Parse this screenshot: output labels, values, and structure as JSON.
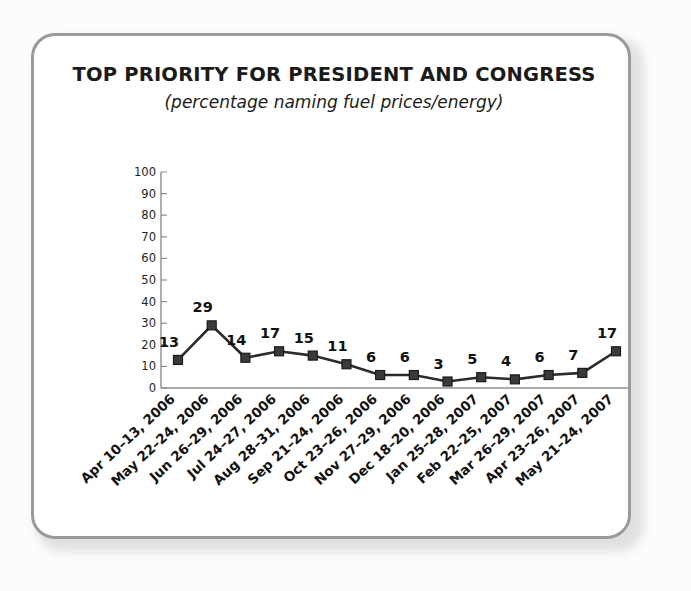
{
  "chart_data": {
    "type": "line",
    "title": "TOP PRIORITY FOR PRESIDENT AND CONGRESS",
    "subtitle": "(percentage naming fuel prices/energy)",
    "xlabel": "",
    "ylabel": "",
    "ylim": [
      0,
      100
    ],
    "ytick_step": 10,
    "yticks": [
      "100",
      "90",
      "80",
      "70",
      "60",
      "50",
      "40",
      "30",
      "20",
      "10",
      "0"
    ],
    "grid": false,
    "legend": false,
    "marker": "square",
    "line_color": "#2b2b2b",
    "marker_color": "#3a3a3a",
    "categories": [
      "Apr 10–13, 2006",
      "May 22–24, 2006",
      "Jun 26–29, 2006",
      "Jul 24–27, 2006",
      "Aug 28–31, 2006",
      "Sep 21–24, 2006",
      "Oct 23–26, 2006",
      "Nov 27–29, 2006",
      "Dec 18–20, 2006",
      "Jan 25–28, 2007",
      "Feb 22–25, 2007",
      "Mar 26–29, 2007",
      "Apr 23–26, 2007",
      "May 21–24, 2007"
    ],
    "values": [
      13,
      29,
      14,
      17,
      15,
      11,
      6,
      6,
      3,
      5,
      4,
      6,
      7,
      17
    ],
    "data_labels": [
      "13",
      "29",
      "14",
      "17",
      "15",
      "11",
      "6",
      "6",
      "3",
      "5",
      "4",
      "6",
      "7",
      "17"
    ]
  }
}
